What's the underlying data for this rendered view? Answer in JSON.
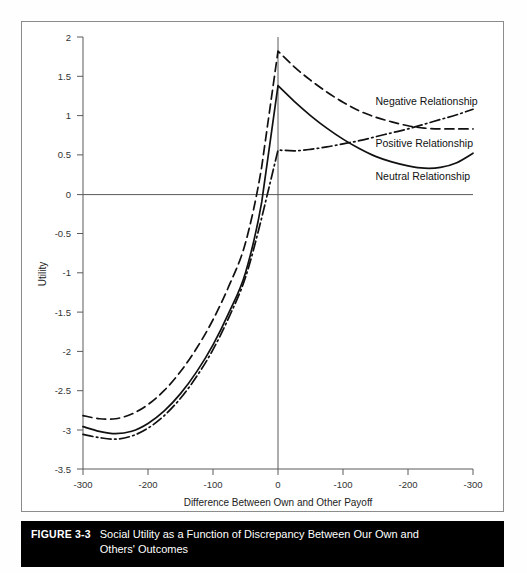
{
  "figure": {
    "number_label": "FIGURE 3-3",
    "caption": "Social Utility as a Function of Discrepancy Between Our Own and Others' Outcomes"
  },
  "chart_data": {
    "type": "line",
    "title": "",
    "xlabel": "Difference Between Own and Other Payoff",
    "ylabel": "Utility",
    "grid": false,
    "legend_position": "inline-right",
    "xlim": [
      -300,
      300
    ],
    "ylim": [
      -3.5,
      2
    ],
    "x_tick_values": [
      -300,
      -200,
      -100,
      0,
      100,
      200,
      300
    ],
    "x_tick_labels": [
      "-300",
      "-200",
      "-100",
      "0",
      "-100",
      "-200",
      "-300"
    ],
    "y_tick_values": [
      2,
      1.5,
      1,
      0.5,
      0,
      -0.5,
      -1,
      -1.5,
      -2,
      -2.5,
      -3,
      -3.5
    ],
    "y_tick_labels": [
      "2",
      "1.5",
      "1",
      "0.5",
      "0",
      "-0.5",
      "-1",
      "-1.5",
      "-2",
      "-2.5",
      "-3",
      "-3.5"
    ],
    "x": [
      -300,
      -275,
      -250,
      -225,
      -200,
      -175,
      -150,
      -125,
      -100,
      -75,
      -50,
      -25,
      0,
      25,
      50,
      75,
      100,
      125,
      150,
      175,
      200,
      225,
      250,
      275,
      300
    ],
    "series": [
      {
        "name": "Negative Relationship",
        "style": "dashed",
        "label_x": 150,
        "label_y": 1.14,
        "values": [
          -2.82,
          -2.86,
          -2.86,
          -2.8,
          -2.68,
          -2.5,
          -2.26,
          -1.96,
          -1.6,
          -1.16,
          -0.62,
          0.35,
          1.82,
          1.62,
          1.45,
          1.3,
          1.17,
          1.06,
          0.98,
          0.92,
          0.87,
          0.84,
          0.83,
          0.83,
          0.83
        ]
      },
      {
        "name": "Positive Relationship",
        "style": "dash-dot",
        "label_x": 150,
        "label_y": 0.6,
        "values": [
          -3.06,
          -3.1,
          -3.12,
          -3.08,
          -2.98,
          -2.82,
          -2.6,
          -2.32,
          -1.98,
          -1.56,
          -1.06,
          -0.3,
          0.56,
          0.55,
          0.57,
          0.6,
          0.64,
          0.68,
          0.73,
          0.78,
          0.83,
          0.89,
          0.95,
          1.01,
          1.08
        ]
      },
      {
        "name": "Neutral Relationship",
        "style": "solid",
        "label_x": 150,
        "label_y": 0.18,
        "values": [
          -2.96,
          -3.02,
          -3.05,
          -3.02,
          -2.92,
          -2.76,
          -2.54,
          -2.26,
          -1.92,
          -1.5,
          -1.0,
          -0.1,
          1.38,
          1.18,
          1.0,
          0.84,
          0.7,
          0.58,
          0.48,
          0.41,
          0.36,
          0.33,
          0.34,
          0.4,
          0.52
        ]
      }
    ]
  }
}
